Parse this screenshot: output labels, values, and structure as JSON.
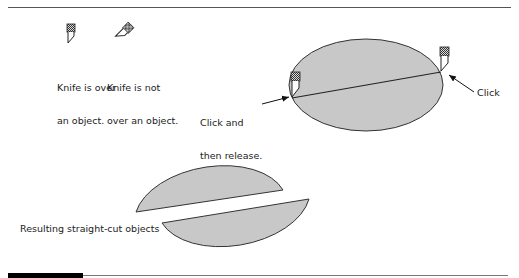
{
  "legend": {
    "knife_over": {
      "icon": "knife-upright-icon",
      "label_line1": "Knife is over",
      "label_line2": "an object."
    },
    "knife_not_over": {
      "icon": "knife-tilted-icon",
      "label_line1": "Knife is not",
      "label_line2": "over an object."
    }
  },
  "steps": {
    "start_label_line1": "Click and",
    "start_label_line2": "then release.",
    "end_label": "Click"
  },
  "result": {
    "label": "Resulting straight-cut objects"
  },
  "colors": {
    "fill": "#c8c8c8",
    "stroke": "#333333"
  }
}
